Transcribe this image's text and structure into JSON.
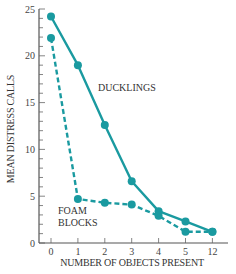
{
  "chart_data": {
    "type": "line",
    "title": "",
    "xlabel": "NUMBER OF OBJECTS PRESENT",
    "ylabel": "MEAN DISTRESS CALLS",
    "categories": [
      "0",
      "1",
      "2",
      "3",
      "4",
      "5",
      "12"
    ],
    "ylim": [
      0,
      25
    ],
    "yticks": [
      0,
      5,
      10,
      15,
      20,
      25
    ],
    "grid": false,
    "legend": "inline labels",
    "series": [
      {
        "name": "DUCKLINGS",
        "style": "solid",
        "color": "#1a9aa0",
        "values": [
          24.2,
          19.0,
          12.6,
          6.6,
          3.4,
          2.3,
          1.2
        ]
      },
      {
        "name": "FOAM BLOCKS",
        "label_lines": [
          "FOAM",
          "BLOCKS"
        ],
        "style": "dashed",
        "color": "#1a9aa0",
        "values": [
          21.9,
          4.7,
          4.3,
          4.1,
          2.9,
          1.2,
          1.2
        ]
      }
    ]
  }
}
